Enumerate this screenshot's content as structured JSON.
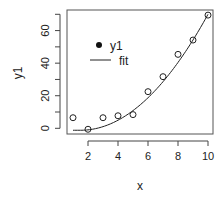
{
  "chart_data": {
    "type": "scatter",
    "title": "",
    "xlabel": "x",
    "ylabel": "y1",
    "xlim": [
      0.6,
      10.3
    ],
    "ylim": [
      -3,
      72
    ],
    "xticks": [
      2,
      4,
      6,
      8,
      10
    ],
    "yticks": [
      0,
      20,
      40,
      60
    ],
    "yticks_minor": [
      10,
      30,
      50,
      70
    ],
    "grid": false,
    "legend_position": "upper-left-inside",
    "series": [
      {
        "name": "y1",
        "kind": "points",
        "marker": "open-circle",
        "x": [
          1,
          2,
          3,
          4,
          5,
          6,
          7,
          8,
          9,
          10
        ],
        "y": [
          6.5,
          -0.6,
          6.5,
          7.7,
          8.4,
          22.5,
          31.7,
          45.4,
          54.2,
          69.5
        ]
      },
      {
        "name": "fit",
        "kind": "line",
        "x": [
          1,
          2,
          3,
          4,
          5,
          6,
          7,
          8,
          9,
          10
        ],
        "y": [
          -1.0,
          -1.0,
          1.0,
          5.0,
          10.9,
          18.7,
          28.6,
          40.4,
          54.2,
          70.0
        ]
      }
    ]
  },
  "legend": {
    "items": [
      {
        "label": "y1",
        "symbol": "filled-dot"
      },
      {
        "label": "fit",
        "symbol": "line"
      }
    ]
  },
  "colors": {
    "ink": "#222222",
    "axis": "#444444"
  }
}
